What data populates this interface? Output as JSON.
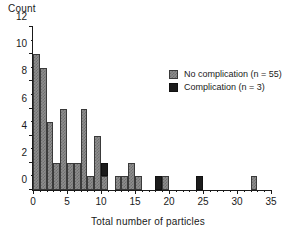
{
  "chart_data": {
    "type": "bar",
    "title": "",
    "xlabel": "Total number of particles",
    "ylabel": "Count",
    "xlim": [
      0,
      35
    ],
    "ylim": [
      0,
      12
    ],
    "grid": false,
    "legend_position": "upper-right",
    "xticks": [
      0,
      5,
      10,
      15,
      20,
      25,
      30,
      35
    ],
    "xtick_labels": [
      "0",
      "5",
      "10",
      "15",
      "20",
      "25",
      "30",
      "35"
    ],
    "x_minor_tick_step": 1,
    "yticks": [
      0,
      2,
      4,
      6,
      8,
      10,
      12
    ],
    "ytick_labels": [
      "0",
      "2",
      "4",
      "6",
      "8",
      "10",
      "12"
    ],
    "y_minor_tick_step": 1,
    "stacked": true,
    "bin_width": 1,
    "series": [
      {
        "name": "No complication (n = 55)",
        "color": "#8e8e8e",
        "fill": "checkered-gray",
        "x": [
          0,
          1,
          2,
          3,
          4,
          5,
          6,
          7,
          8,
          9,
          10,
          12,
          13,
          14,
          15,
          19,
          32
        ],
        "values": [
          10,
          9,
          5,
          2,
          6,
          2,
          2,
          6,
          1,
          4,
          1,
          1,
          1,
          2,
          1,
          1,
          1
        ]
      },
      {
        "name": "Complication (n = 3)",
        "color": "#1c1c1c",
        "fill": "solid-black",
        "x": [
          10,
          18,
          24
        ],
        "values": [
          1,
          1,
          1
        ],
        "base": [
          1,
          0,
          0
        ]
      }
    ]
  },
  "legend": {
    "entries": [
      {
        "label": "No complication (n = 55)",
        "swatch": "checkered-gray"
      },
      {
        "label": "Complication (n = 3)",
        "swatch": "solid-black"
      }
    ]
  },
  "colors": {
    "no_complication": "#8e8e8e",
    "complication": "#1c1c1c",
    "axis": "#1a1a1a",
    "background": "#ffffff"
  }
}
